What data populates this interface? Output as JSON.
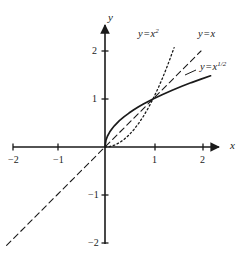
{
  "figure": {
    "kind": "cartesian-plot",
    "background_color": "#ffffff",
    "ink_color": "#1a1a1a"
  },
  "axes": {
    "x_axis_label": "x",
    "y_axis_label": "y",
    "x_range": [
      -2.2,
      2.45
    ],
    "y_range": [
      -2.25,
      2.5
    ],
    "grid": false,
    "x_ticks": [
      {
        "value": -2,
        "label": "−2"
      },
      {
        "value": -1,
        "label": "−1"
      },
      {
        "value": 1,
        "label": "1"
      },
      {
        "value": 2,
        "label": "2"
      }
    ],
    "y_ticks": [
      {
        "value": 2,
        "label": "2"
      },
      {
        "value": 1,
        "label": "1"
      },
      {
        "value": -1,
        "label": "−1"
      },
      {
        "value": -2,
        "label": "−2"
      }
    ],
    "origin_px": {
      "x": 105,
      "y": 147
    },
    "unit_px": 48,
    "arrowheads": [
      "x-positive",
      "y-positive"
    ]
  },
  "chart_data": {
    "type": "line",
    "title": "",
    "xlabel": "x",
    "ylabel": "y",
    "xlim": [
      -2.2,
      2.45
    ],
    "ylim": [
      -2.25,
      2.5
    ],
    "grid": false,
    "legend_position": "inline-annotations",
    "intersection_points": [
      {
        "x": 0,
        "y": 0
      },
      {
        "x": 1,
        "y": 1
      }
    ],
    "series": [
      {
        "name": "y = x^(1/2)",
        "label_text": "y = x",
        "label_exponent": "1/2",
        "style": "solid",
        "width": 1.7,
        "color": "#1a1a1a",
        "domain": [
          0,
          2.2
        ],
        "x": [
          0,
          0.02,
          0.05,
          0.1,
          0.15,
          0.2,
          0.3,
          0.4,
          0.5,
          0.6,
          0.7,
          0.8,
          0.9,
          1,
          1.2,
          1.4,
          1.6,
          1.8,
          2,
          2.2
        ],
        "y": [
          0,
          0.141,
          0.224,
          0.316,
          0.387,
          0.447,
          0.548,
          0.632,
          0.707,
          0.775,
          0.837,
          0.894,
          0.949,
          1,
          1.095,
          1.183,
          1.265,
          1.342,
          1.414,
          1.483
        ]
      },
      {
        "name": "y = x",
        "label_text": "y = x",
        "label_exponent": "",
        "style": "dashed",
        "width": 1.1,
        "color": "#1a1a1a",
        "domain": [
          -2.05,
          2.0
        ],
        "x": [
          -2.05,
          -1,
          0,
          1,
          2.0
        ],
        "y": [
          -2.05,
          -1,
          0,
          1,
          2.0
        ]
      },
      {
        "name": "y = x^2",
        "label_text": "y = x",
        "label_exponent": "2",
        "style": "dotted",
        "width": 1.3,
        "color": "#1a1a1a",
        "domain": [
          0,
          1.44
        ],
        "x": [
          0,
          0.1,
          0.2,
          0.3,
          0.4,
          0.5,
          0.6,
          0.7,
          0.8,
          0.9,
          1,
          1.1,
          1.2,
          1.3,
          1.44
        ],
        "y": [
          0,
          0.01,
          0.04,
          0.09,
          0.16,
          0.25,
          0.36,
          0.49,
          0.64,
          0.81,
          1,
          1.21,
          1.44,
          1.69,
          2.07
        ]
      }
    ],
    "annotations": [
      {
        "name": "label-x-squared",
        "text": "y = x",
        "exponent": "2",
        "at_px": {
          "x": 138,
          "y": 29
        }
      },
      {
        "name": "label-x",
        "text": "y = x",
        "exponent": "",
        "at_px": {
          "x": 198,
          "y": 29
        }
      },
      {
        "name": "label-sqrt-x",
        "text": "y = x",
        "exponent": "1/2",
        "at_px": {
          "x": 200,
          "y": 62
        }
      }
    ]
  },
  "labels": {
    "x_squared": {
      "lhs": "y",
      "eq": "=",
      "base": "x",
      "exp": "2"
    },
    "x_linear": {
      "lhs": "y",
      "eq": "=",
      "base": "x",
      "exp": ""
    },
    "x_sqrt": {
      "lhs": "y",
      "eq": "=",
      "base": "x",
      "exp": "1/2"
    }
  }
}
